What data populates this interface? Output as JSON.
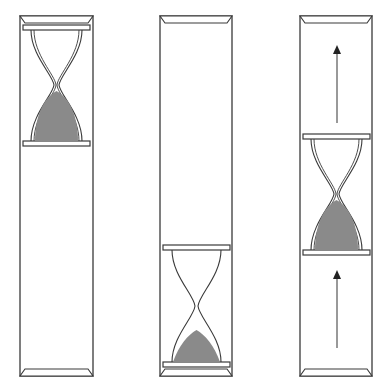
{
  "figure": {
    "colors": {
      "background": "#ffffff",
      "outline": "#3a3a3a",
      "sand": "#8a8a8a",
      "arrow": "#222222"
    },
    "panels": [
      {
        "id": "panel-1",
        "tube": {
          "x": 20,
          "y": 16,
          "w": 73,
          "h": 360
        },
        "hourglass": {
          "top_shelf_y": 25,
          "bottom_shelf_y": 141,
          "position": "top",
          "sand": "bottom-full"
        },
        "arrows": []
      },
      {
        "id": "panel-2",
        "tube": {
          "x": 160,
          "y": 16,
          "w": 72,
          "h": 360
        },
        "hourglass": {
          "top_shelf_y": 245,
          "bottom_shelf_y": 362,
          "position": "bottom",
          "sand": "bottom-pile"
        },
        "arrows": []
      },
      {
        "id": "panel-3",
        "tube": {
          "x": 300,
          "y": 16,
          "w": 72,
          "h": 360
        },
        "hourglass": {
          "top_shelf_y": 134,
          "bottom_shelf_y": 250,
          "position": "middle",
          "sand": "bottom-full"
        },
        "arrows": [
          {
            "x": 337,
            "y_tail": 123,
            "y_head": 46,
            "direction": "up"
          },
          {
            "x": 337,
            "y_tail": 348,
            "y_head": 271,
            "direction": "up"
          }
        ]
      }
    ]
  }
}
